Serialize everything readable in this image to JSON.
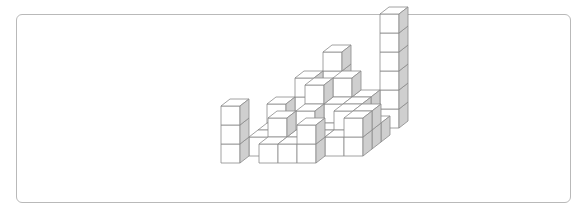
{
  "figure": {
    "cube_size_px": 19,
    "depth_offset_px": [
      9,
      -7
    ],
    "colors": {
      "face": "#ffffff",
      "side": "#cfcfcf",
      "edge": "#8a8a8a",
      "frame": "#b9b9b9"
    },
    "origin_px": [
      221,
      163
    ],
    "cubes": [
      [
        0,
        0,
        0
      ],
      [
        0,
        0,
        1
      ],
      [
        0,
        0,
        2
      ],
      [
        2,
        0,
        0
      ],
      [
        3,
        0,
        0
      ],
      [
        4,
        0,
        0
      ],
      [
        4,
        0,
        1
      ],
      [
        1,
        1,
        0
      ],
      [
        2,
        1,
        0
      ],
      [
        2,
        1,
        1
      ],
      [
        3,
        1,
        0
      ],
      [
        4,
        1,
        0
      ],
      [
        5,
        1,
        0
      ],
      [
        6,
        1,
        0
      ],
      [
        6,
        1,
        1
      ],
      [
        1,
        2,
        0
      ],
      [
        2,
        2,
        0
      ],
      [
        3,
        2,
        0
      ],
      [
        3,
        2,
        1
      ],
      [
        4,
        2,
        0
      ],
      [
        5,
        2,
        0
      ],
      [
        5,
        2,
        1
      ],
      [
        6,
        2,
        0
      ],
      [
        6,
        2,
        1
      ],
      [
        1,
        3,
        0
      ],
      [
        1,
        3,
        1
      ],
      [
        2,
        3,
        0
      ],
      [
        3,
        3,
        0
      ],
      [
        3,
        3,
        1
      ],
      [
        3,
        3,
        2
      ],
      [
        4,
        3,
        0
      ],
      [
        4,
        3,
        1
      ],
      [
        5,
        3,
        0
      ],
      [
        5,
        3,
        1
      ],
      [
        6,
        3,
        0
      ],
      [
        2,
        4,
        0
      ],
      [
        2,
        4,
        1
      ],
      [
        2,
        4,
        2
      ],
      [
        3,
        4,
        0
      ],
      [
        3,
        4,
        1
      ],
      [
        4,
        4,
        0
      ],
      [
        4,
        4,
        1
      ],
      [
        4,
        4,
        2
      ],
      [
        5,
        4,
        0
      ],
      [
        5,
        4,
        1
      ],
      [
        3,
        5,
        0
      ],
      [
        3,
        5,
        1
      ],
      [
        3,
        5,
        2
      ],
      [
        3,
        5,
        3
      ],
      [
        6,
        5,
        0
      ],
      [
        6,
        5,
        1
      ],
      [
        6,
        5,
        2
      ],
      [
        6,
        5,
        3
      ],
      [
        6,
        5,
        4
      ],
      [
        6,
        5,
        5
      ]
    ]
  }
}
